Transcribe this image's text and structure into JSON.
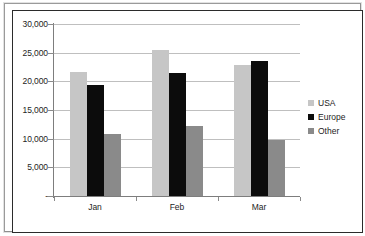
{
  "chart_data": {
    "type": "bar",
    "title": "",
    "subtitle": "",
    "xlabel": "",
    "ylabel": "",
    "categories": [
      "Jan",
      "Feb",
      "Mar"
    ],
    "series": [
      {
        "name": "USA",
        "color": "#c6c6c6",
        "values": [
          21700,
          25400,
          22800
        ]
      },
      {
        "name": "Europe",
        "color": "#0c0c0c",
        "values": [
          19300,
          21400,
          23600
        ]
      },
      {
        "name": "Other",
        "color": "#8a8a8a",
        "values": [
          10800,
          12200,
          9800
        ]
      }
    ],
    "ylim": [
      0,
      30000
    ],
    "y_ticks": [
      0,
      5000,
      10000,
      15000,
      20000,
      25000,
      30000
    ],
    "y_tick_labels": [
      "-",
      "5,000",
      "10,000",
      "15,000",
      "20,000",
      "25,000",
      "30,000"
    ],
    "grid": true,
    "legend_position": "right"
  },
  "legend": {
    "items": [
      {
        "label": "USA"
      },
      {
        "label": "Europe"
      },
      {
        "label": "Other"
      }
    ]
  }
}
